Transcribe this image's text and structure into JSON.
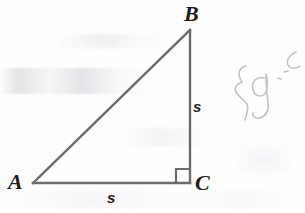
{
  "figure": {
    "kind": "right-triangle-diagram",
    "background_color": "#fefefe",
    "stroke_color": "#6b6b6b",
    "stroke_width": 2.2,
    "label_color": "#1c1c1c",
    "vertices": [
      {
        "name": "A",
        "label": "A",
        "x": 33,
        "y": 183,
        "label_x": 8,
        "label_y": 171
      },
      {
        "name": "B",
        "label": "B",
        "x": 190,
        "y": 30,
        "label_x": 184,
        "label_y": 3
      },
      {
        "name": "C",
        "label": "C",
        "x": 190,
        "y": 183,
        "label_x": 195,
        "label_y": 172
      }
    ],
    "sides": [
      {
        "name": "AC",
        "label": "s",
        "from": "A",
        "to": "C",
        "label_x": 107,
        "label_y": 190
      },
      {
        "name": "BC",
        "label": "s",
        "from": "B",
        "to": "C",
        "label_x": 193,
        "label_y": 99
      },
      {
        "name": "AB",
        "label": "",
        "from": "A",
        "to": "B",
        "label_x": 0,
        "label_y": 0
      }
    ],
    "right_angle": {
      "at_vertex": "C",
      "marker": "square",
      "size": 14,
      "x": 176,
      "y": 169
    }
  },
  "annotation": {
    "kind": "pencil-handwriting",
    "text": "{g",
    "opacity": 0.62,
    "x": 222,
    "y": 34,
    "color": "#9a9aa3"
  }
}
